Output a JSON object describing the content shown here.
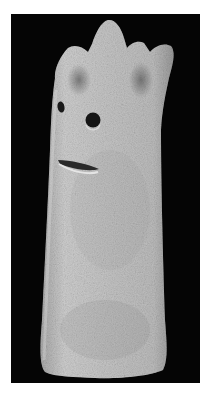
{
  "image": {
    "subject": "Stone figure with crown of points and carved face",
    "alt": "Photograph of a pale grey porous stone cylindrical figure on a black background, topped with five pointed crown-like projections, with two drilled eye holes and a carved slit mouth.",
    "colors": {
      "page_background": "#ffffff",
      "backdrop": "#050505",
      "stone_light": "#d6d6d6",
      "stone_mid": "#b8b8b8",
      "stone_dark": "#7a7a7a",
      "feature_dark": "#1a1a1a"
    }
  }
}
